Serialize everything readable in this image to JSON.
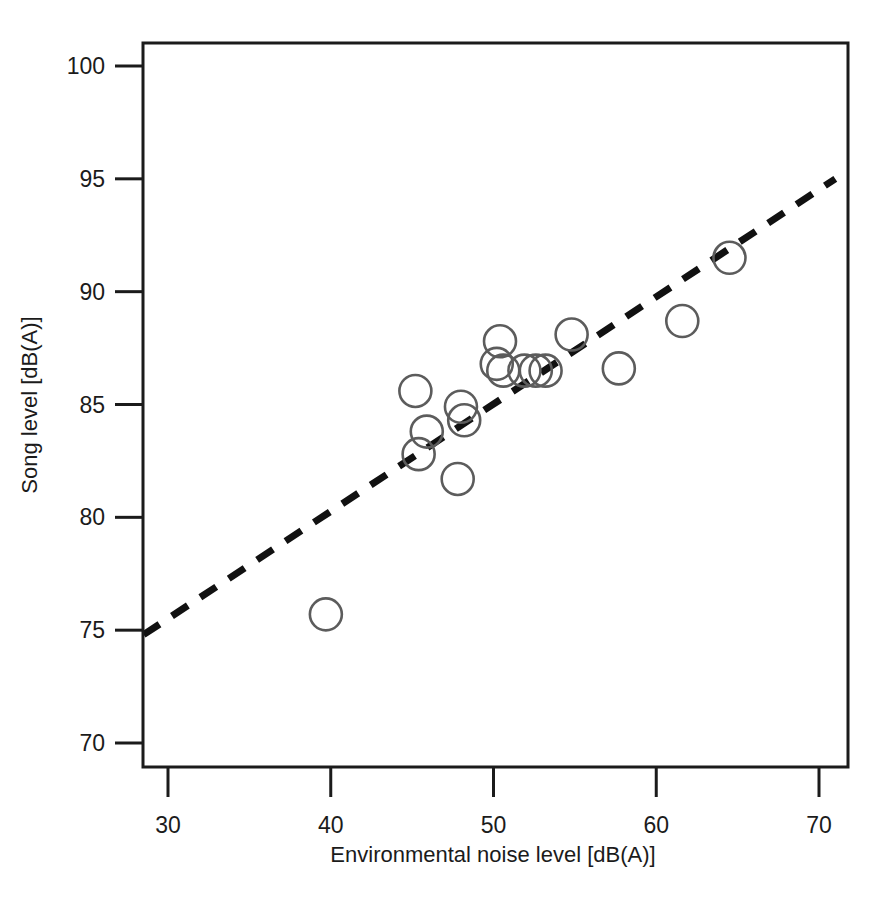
{
  "figure": {
    "background_color": "#ffffff",
    "frame_color": "#1b1b1b",
    "point_color": "#5c5c5c",
    "trend_color": "#111111"
  },
  "chart_data": {
    "type": "scatter",
    "title": "",
    "xlabel": "Environmental noise level [dB(A)]",
    "ylabel": "Song level [dB(A)]",
    "xlim": [
      28.5,
      71.5
    ],
    "ylim": [
      68.5,
      101.5
    ],
    "xticks": [
      30,
      40,
      50,
      60,
      70
    ],
    "yticks": [
      70,
      75,
      80,
      85,
      90,
      95,
      100
    ],
    "xtick_labels": [
      "30",
      "40",
      "50",
      "60",
      "70"
    ],
    "ytick_labels": [
      "70",
      "75",
      "80",
      "85",
      "90",
      "95",
      "100"
    ],
    "grid": false,
    "legend": false,
    "marker": "open-circle",
    "x": [
      39.7,
      45.2,
      45.4,
      45.9,
      47.8,
      48.0,
      48.2,
      50.2,
      50.4,
      50.6,
      51.9,
      52.6,
      53.2,
      54.8,
      57.7,
      61.6,
      64.5
    ],
    "y": [
      75.7,
      85.6,
      82.8,
      83.8,
      81.7,
      84.9,
      84.3,
      86.8,
      87.8,
      86.5,
      86.5,
      86.5,
      86.5,
      88.1,
      86.6,
      88.7,
      91.5
    ],
    "points": [
      {
        "x": 39.7,
        "y": 75.7
      },
      {
        "x": 45.2,
        "y": 85.6
      },
      {
        "x": 45.4,
        "y": 82.8
      },
      {
        "x": 45.9,
        "y": 83.8
      },
      {
        "x": 47.8,
        "y": 81.7
      },
      {
        "x": 48.0,
        "y": 84.9
      },
      {
        "x": 48.2,
        "y": 84.3
      },
      {
        "x": 50.2,
        "y": 86.8
      },
      {
        "x": 50.4,
        "y": 87.8
      },
      {
        "x": 50.6,
        "y": 86.5
      },
      {
        "x": 51.9,
        "y": 86.5
      },
      {
        "x": 52.6,
        "y": 86.5
      },
      {
        "x": 53.2,
        "y": 86.5
      },
      {
        "x": 54.8,
        "y": 88.1
      },
      {
        "x": 57.7,
        "y": 86.6
      },
      {
        "x": 61.6,
        "y": 88.7
      },
      {
        "x": 64.5,
        "y": 91.5
      }
    ],
    "trend": {
      "style": "dashed",
      "x_start": 28.5,
      "y_start": 74.8,
      "x_end": 71.0,
      "y_end": 95.0
    }
  }
}
